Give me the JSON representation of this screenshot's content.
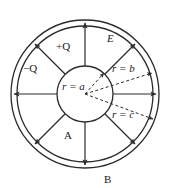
{
  "figure": {
    "stroke_color": "#2b2b2b",
    "background": "#ffffff",
    "center": {
      "x": 85,
      "y": 94
    }
  },
  "circles": {
    "inner_sphere": {
      "name": "inner-sphere",
      "radius": 28,
      "label": "r = a"
    },
    "shell_inner": {
      "name": "shell-inner-surface",
      "radius": 68,
      "label": "r = b"
    },
    "shell_outer": {
      "name": "shell-outer-surface",
      "radius": 74,
      "label": "r = c"
    }
  },
  "labels": {
    "inner_charge": "+Q",
    "shell_charge": "−Q",
    "field": "E",
    "radius_a": "r = a",
    "radius_b": "r = b",
    "radius_c": "r = c",
    "region_a": "A",
    "region_b": "B"
  },
  "field_arrows": {
    "count": 8,
    "angles_deg": [
      270,
      315,
      0,
      45,
      90,
      135,
      180,
      225
    ],
    "start_radius": 28,
    "end_radius": 71,
    "description": "Radial electric field lines pointing outward from the inner sphere"
  },
  "dashed_radii": [
    {
      "name": "radius-line-a",
      "angle_deg": 312,
      "length": 28,
      "label": "r = a"
    },
    {
      "name": "radius-line-b",
      "angle_deg": 342,
      "length": 70,
      "label": "r = b"
    },
    {
      "name": "radius-line-c",
      "angle_deg": 20,
      "length": 72,
      "label": "r = c"
    }
  ]
}
